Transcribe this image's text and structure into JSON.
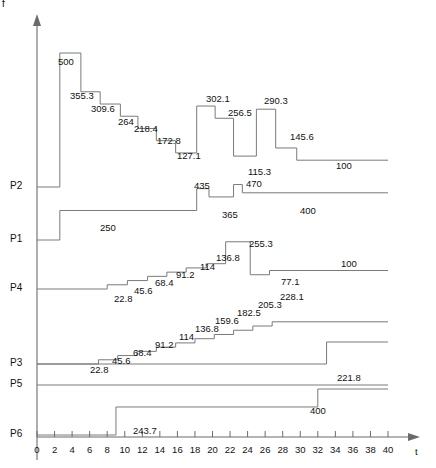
{
  "figure": {
    "y_axis_label": "f",
    "x_axis_label": "t",
    "x_ticks": [
      0,
      2,
      4,
      6,
      8,
      10,
      12,
      14,
      16,
      18,
      20,
      22,
      24,
      26,
      28,
      30,
      32,
      34,
      36,
      38,
      40
    ],
    "baseline_labels": [
      "P2",
      "P1",
      "P4",
      "P3",
      "P5",
      "P6"
    ]
  },
  "chart_data": {
    "type": "line",
    "title": "",
    "xlabel": "t",
    "ylabel": "f",
    "xlim": [
      0,
      40
    ],
    "grid": false,
    "legend": null,
    "style": "step-post staircase, one baseline per process",
    "categories": [
      "P2",
      "P1",
      "P4",
      "P3",
      "P5",
      "P6"
    ],
    "series": [
      {
        "name": "P2",
        "baseline_px": 187,
        "annotations": [
          "500",
          "355.3",
          "309.6",
          "264",
          "218.4",
          "172.8",
          "127.1",
          "302.1",
          "256.5",
          "115.3",
          "290.3",
          "145.6",
          "100"
        ],
        "steps": [
          {
            "t": 0.0,
            "value": 0,
            "label": null
          },
          {
            "t": 2.6,
            "value": 500,
            "label": "500"
          },
          {
            "t": 5.0,
            "value": 355.3,
            "label": "355.3"
          },
          {
            "t": 7.2,
            "value": 309.6,
            "label": "309.6"
          },
          {
            "t": 9.5,
            "value": 264,
            "label": "264"
          },
          {
            "t": 11.5,
            "value": 218.4,
            "label": "218.4"
          },
          {
            "t": 13.6,
            "value": 172.8,
            "label": "172.8"
          },
          {
            "t": 15.8,
            "value": 127.1,
            "label": "127.1"
          },
          {
            "t": 18.2,
            "value": 302.1,
            "label": "302.1"
          },
          {
            "t": 20.3,
            "value": 256.5,
            "label": "256.5"
          },
          {
            "t": 22.4,
            "value": 115.3,
            "label": "115.3"
          },
          {
            "t": 25.0,
            "value": 290.3,
            "label": "290.3"
          },
          {
            "t": 27.2,
            "value": 145.6,
            "label": "145.6"
          },
          {
            "t": 29.6,
            "value": 100,
            "label": "100"
          },
          {
            "t": 40.0,
            "value": 100,
            "label": null
          }
        ]
      },
      {
        "name": "P1",
        "baseline_px": 240,
        "annotations": [
          "250",
          "435",
          "365",
          "470",
          "400"
        ],
        "steps": [
          {
            "t": 0.0,
            "value": 0,
            "label": null
          },
          {
            "t": 2.6,
            "value": 250,
            "label": "250"
          },
          {
            "t": 18.2,
            "value": 435,
            "label": "435"
          },
          {
            "t": 19.6,
            "value": 365,
            "label": "365"
          },
          {
            "t": 22.4,
            "value": 470,
            "label": "470"
          },
          {
            "t": 23.4,
            "value": 400,
            "label": "400"
          },
          {
            "t": 40.0,
            "value": 400,
            "label": null
          }
        ]
      },
      {
        "name": "P4",
        "baseline_px": 289,
        "annotations": [
          "22.8",
          "45.6",
          "68.4",
          "91.2",
          "114",
          "136.8",
          "255.3",
          "77.1",
          "100"
        ],
        "steps": [
          {
            "t": 0.0,
            "value": 0,
            "label": null
          },
          {
            "t": 8.0,
            "value": 22.8,
            "label": "22.8"
          },
          {
            "t": 10.3,
            "value": 45.6,
            "label": "45.6"
          },
          {
            "t": 12.6,
            "value": 68.4,
            "label": "68.4"
          },
          {
            "t": 14.8,
            "value": 91.2,
            "label": "91.2"
          },
          {
            "t": 17.0,
            "value": 114,
            "label": "114"
          },
          {
            "t": 19.3,
            "value": 136.8,
            "label": "136.8"
          },
          {
            "t": 21.5,
            "value": 255.3,
            "label": "255.3"
          },
          {
            "t": 24.3,
            "value": 77.1,
            "label": "77.1"
          },
          {
            "t": 26.5,
            "value": 100,
            "label": "100"
          },
          {
            "t": 40.0,
            "value": 100,
            "label": null
          }
        ]
      },
      {
        "name": "P3",
        "baseline_px": 364,
        "annotations": [
          "22.8",
          "45.6",
          "68.4",
          "91.2",
          "114",
          "136.8",
          "159.6",
          "182.5",
          "205.3",
          "228.1",
          "221.8"
        ],
        "steps": [
          {
            "t": 0.0,
            "value": 0,
            "label": null
          },
          {
            "t": 7.0,
            "value": 22.8,
            "label": "22.8"
          },
          {
            "t": 9.2,
            "value": 45.6,
            "label": "45.6"
          },
          {
            "t": 11.4,
            "value": 68.4,
            "label": "68.4"
          },
          {
            "t": 13.6,
            "value": 91.2,
            "label": "91.2"
          },
          {
            "t": 15.8,
            "value": 114,
            "label": "114"
          },
          {
            "t": 18.0,
            "value": 136.8,
            "label": "136.8"
          },
          {
            "t": 20.2,
            "value": 159.6,
            "label": "159.6"
          },
          {
            "t": 22.4,
            "value": 182.5,
            "label": "182.5"
          },
          {
            "t": 24.6,
            "value": 205.3,
            "label": "205.3"
          },
          {
            "t": 26.8,
            "value": 228.1,
            "label": "228.1"
          },
          {
            "t": 40.0,
            "value": 228.1,
            "label": null
          }
        ],
        "second_branch": {
          "label": "221.8",
          "t_rise": 33.0,
          "t_end": 40.0
        }
      },
      {
        "name": "P5",
        "baseline_px": 385,
        "annotations": [],
        "steps": [
          {
            "t": 0.0,
            "value": 0,
            "label": null
          },
          {
            "t": 40.0,
            "value": 0,
            "label": null
          }
        ]
      },
      {
        "name": "P6",
        "baseline_px": 435,
        "annotations": [
          "243.7",
          "400"
        ],
        "steps": [
          {
            "t": 0.0,
            "value": 0,
            "label": null
          },
          {
            "t": 9.0,
            "value": 243.7,
            "label": "243.7"
          },
          {
            "t": 32.0,
            "value": 400,
            "label": "400"
          },
          {
            "t": 40.0,
            "value": 400,
            "label": null
          }
        ]
      }
    ]
  },
  "value_labels": [
    {
      "text": "500",
      "x": 58,
      "y": 56,
      "series": "P2"
    },
    {
      "text": "355.3",
      "x": 70,
      "y": 90,
      "series": "P2"
    },
    {
      "text": "309.6",
      "x": 91,
      "y": 103,
      "series": "P2"
    },
    {
      "text": "264",
      "x": 118,
      "y": 116,
      "series": "P2"
    },
    {
      "text": "218.4",
      "x": 134,
      "y": 123,
      "series": "P2"
    },
    {
      "text": "172.8",
      "x": 157,
      "y": 135,
      "series": "P2"
    },
    {
      "text": "127.1",
      "x": 177,
      "y": 150,
      "series": "P2"
    },
    {
      "text": "302.1",
      "x": 206,
      "y": 93,
      "series": "P2"
    },
    {
      "text": "256.5",
      "x": 228,
      "y": 107,
      "series": "P2"
    },
    {
      "text": "115.3",
      "x": 248,
      "y": 166,
      "series": "P2"
    },
    {
      "text": "290.3",
      "x": 264,
      "y": 95,
      "series": "P2"
    },
    {
      "text": "145.6",
      "x": 290,
      "y": 131,
      "series": "P2"
    },
    {
      "text": "100",
      "x": 336,
      "y": 160,
      "series": "P2"
    },
    {
      "text": "435",
      "x": 194,
      "y": 180,
      "series": "P1"
    },
    {
      "text": "365",
      "x": 222,
      "y": 209,
      "series": "P1"
    },
    {
      "text": "470",
      "x": 246,
      "y": 178,
      "series": "P1"
    },
    {
      "text": "400",
      "x": 300,
      "y": 205,
      "series": "P1"
    },
    {
      "text": "250",
      "x": 100,
      "y": 222,
      "series": "P1"
    },
    {
      "text": "22.8",
      "x": 114,
      "y": 293,
      "series": "P4"
    },
    {
      "text": "45.6",
      "x": 134,
      "y": 285,
      "series": "P4"
    },
    {
      "text": "68.4",
      "x": 155,
      "y": 277,
      "series": "P4"
    },
    {
      "text": "91.2",
      "x": 176,
      "y": 269,
      "series": "P4"
    },
    {
      "text": "114",
      "x": 200,
      "y": 261,
      "series": "P4"
    },
    {
      "text": "136.8",
      "x": 216,
      "y": 252,
      "series": "P4"
    },
    {
      "text": "255.3",
      "x": 249,
      "y": 238,
      "series": "P4"
    },
    {
      "text": "77.1",
      "x": 281,
      "y": 276,
      "series": "P4"
    },
    {
      "text": "100",
      "x": 341,
      "y": 258,
      "series": "P4"
    },
    {
      "text": "22.8",
      "x": 90,
      "y": 364,
      "series": "P3"
    },
    {
      "text": "45.6",
      "x": 112,
      "y": 355,
      "series": "P3"
    },
    {
      "text": "68.4",
      "x": 133,
      "y": 347,
      "series": "P3"
    },
    {
      "text": "91.2",
      "x": 155,
      "y": 339,
      "series": "P3"
    },
    {
      "text": "114",
      "x": 179,
      "y": 331,
      "series": "P3"
    },
    {
      "text": "136.8",
      "x": 195,
      "y": 323,
      "series": "P3"
    },
    {
      "text": "159.6",
      "x": 215,
      "y": 315,
      "series": "P3"
    },
    {
      "text": "182.5",
      "x": 237,
      "y": 307,
      "series": "P3"
    },
    {
      "text": "205.3",
      "x": 258,
      "y": 299,
      "series": "P3"
    },
    {
      "text": "228.1",
      "x": 280,
      "y": 291,
      "series": "P3"
    },
    {
      "text": "221.8",
      "x": 337,
      "y": 372,
      "series": "P3"
    },
    {
      "text": "243.7",
      "x": 133,
      "y": 425,
      "series": "P6"
    },
    {
      "text": "400",
      "x": 310,
      "y": 405,
      "series": "P6"
    }
  ]
}
